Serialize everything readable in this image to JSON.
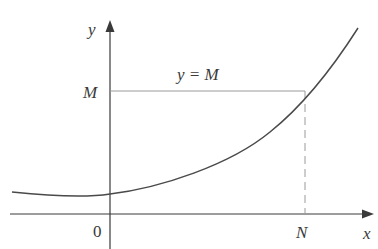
{
  "diagram": {
    "axes": {
      "x_label": "x",
      "y_label": "y",
      "origin_label": "0"
    },
    "horizontal_line": {
      "label": "y = M",
      "value_label": "M"
    },
    "vertical_marker": {
      "label": "N"
    },
    "colors": {
      "curve": "#4a4a4a",
      "axes": "#3a3a3a",
      "guide_lines": "#9a9a9a",
      "text": "#3a3a3a"
    },
    "curve_description": "increasing convex curve with a minimum slightly left of the y-axis, crossing y = M at x = N"
  }
}
